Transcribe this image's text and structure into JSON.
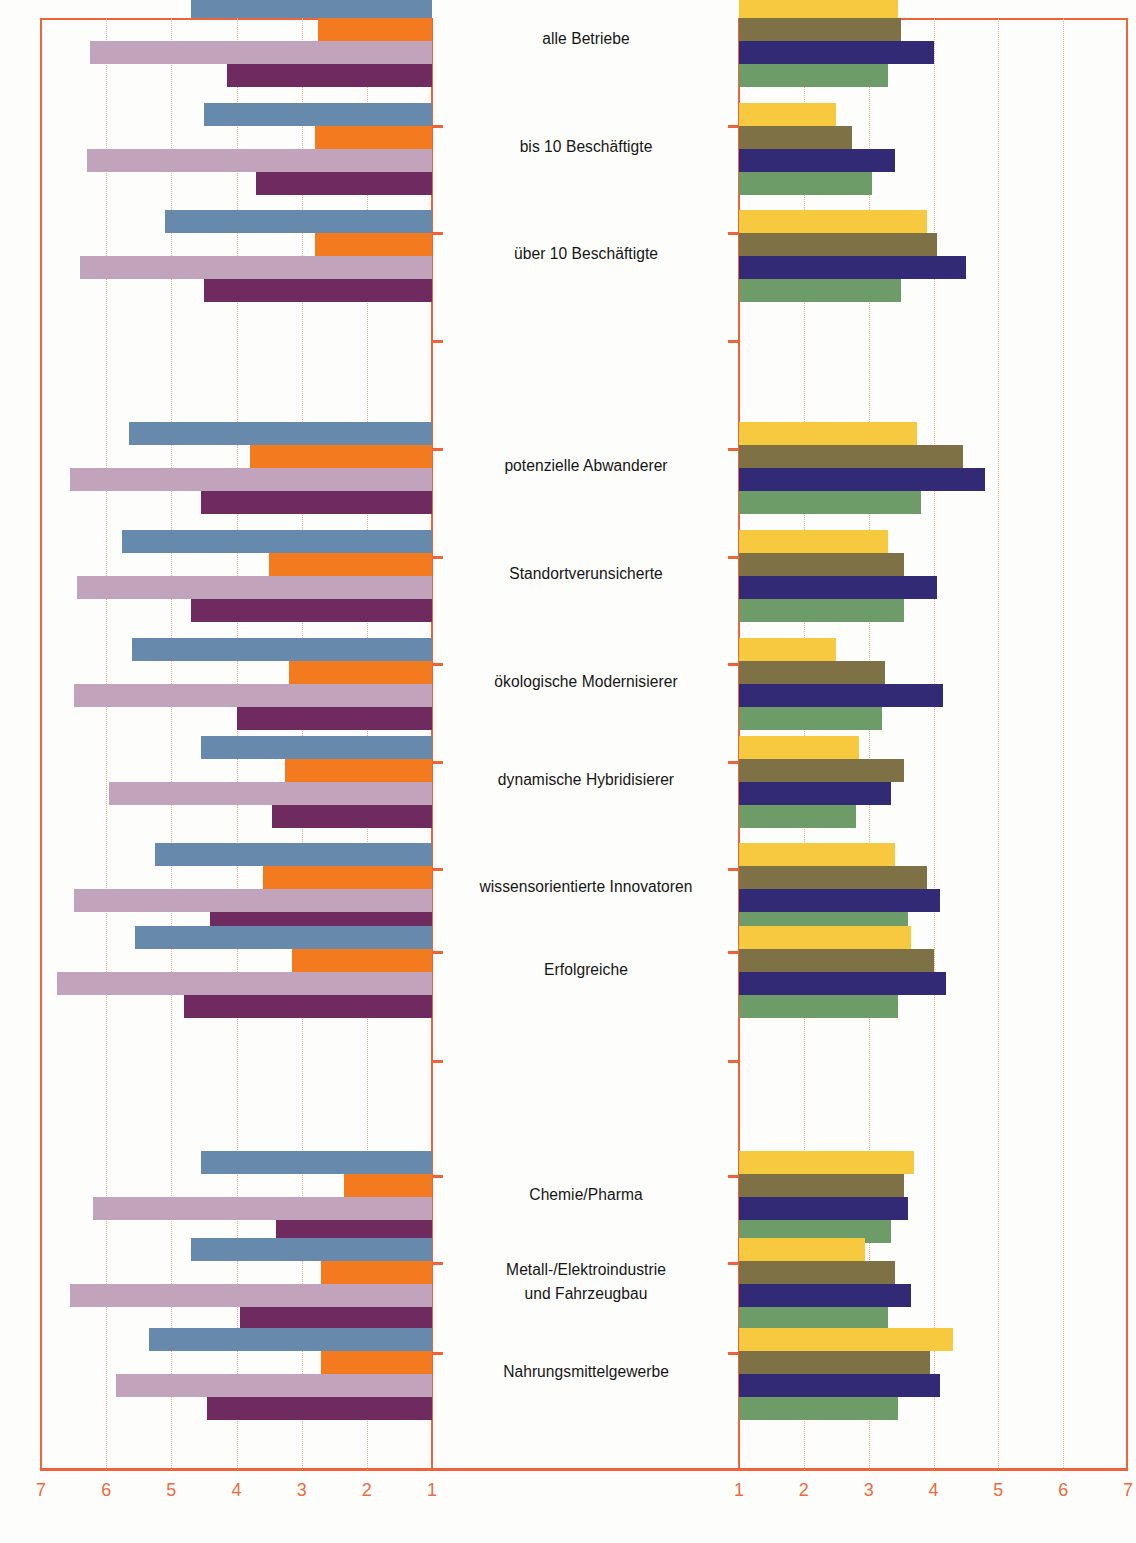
{
  "source_note": "(Quellen: eigene Erhebungen)",
  "axes": {
    "left_ticks": [
      7,
      6,
      5,
      4,
      3,
      2,
      1
    ],
    "right_ticks": [
      1,
      2,
      3,
      4,
      5,
      6,
      7
    ],
    "left_label_values": [
      "7",
      "6",
      "5",
      "4",
      "3",
      "2",
      "1"
    ],
    "right_label_values": [
      "1",
      "2",
      "3",
      "4",
      "5",
      "6",
      "7"
    ],
    "grid_color": "#f3a98b",
    "axis_color": "#f0623a",
    "range": [
      1,
      7
    ]
  },
  "palette": {
    "blue": "#6789ab",
    "orange": "#f37a1f",
    "light_mauve": "#c2a3bc",
    "dark_purple": "#6f2a5f",
    "yellow": "#f6c93f",
    "brown": "#7e7146",
    "navy": "#332a76",
    "green": "#6d9c69"
  },
  "categories": [
    {
      "label": "alle Betriebe",
      "lines": [
        "alle Betriebe"
      ]
    },
    {
      "label": "bis 10 Beschäftigte",
      "lines": [
        "bis 10 Beschäftigte"
      ]
    },
    {
      "label": "über 10 Beschäftigte",
      "lines": [
        "über 10 Beschäftigte"
      ]
    },
    {
      "label": "potenzielle Abwanderer",
      "lines": [
        "potenzielle Abwanderer"
      ]
    },
    {
      "label": "Standortverunsicherte",
      "lines": [
        "Standortverunsicherte"
      ]
    },
    {
      "label": "ökologische Modernisierer",
      "lines": [
        "ökologische Modernisierer"
      ]
    },
    {
      "label": "dynamische Hybridisierer",
      "lines": [
        "dynamische Hybridisierer"
      ]
    },
    {
      "label": "wissensorientierte Innovatoren",
      "lines": [
        "wissensorientierte Innovatoren"
      ]
    },
    {
      "label": "Erfolgreiche",
      "lines": [
        "Erfolgreiche"
      ]
    },
    {
      "label": "Chemie/Pharma",
      "lines": [
        "Chemie/Pharma"
      ]
    },
    {
      "label": "Metall-/Elektroindustrie und Fahrzeugbau",
      "lines": [
        "Metall-/Elektroindustrie",
        "und Fahrzeugbau"
      ]
    },
    {
      "label": "Nahrungsmittelgewerbe",
      "lines": [
        "Nahrungsmittelgewerbe"
      ]
    }
  ],
  "chart_data": {
    "type": "bar",
    "orientation": "horizontal",
    "layout": "two mirrored horizontal bar panels sharing central category labels; left panel axis runs 7→1 (right-anchored), right panel axis runs 1→7 (left-anchored)",
    "title": "",
    "xlabel": "",
    "ylabel": "",
    "xlim": [
      1,
      7
    ],
    "grid": true,
    "legend": "none shown",
    "categories": [
      "alle Betriebe",
      "bis 10 Beschäftigte",
      "über 10 Beschäftigte",
      "potenzielle Abwanderer",
      "Standortverunsicherte",
      "ökologische Modernisierer",
      "dynamische Hybridisierer",
      "wissensorientierte Innovatoren",
      "Erfolgreiche",
      "Chemie/Pharma",
      "Metall-/Elektroindustrie und Fahrzeugbau",
      "Nahrungsmittelgewerbe"
    ],
    "left_panel": {
      "axis_direction": "descending 7 to 1",
      "series": [
        {
          "name": "blue",
          "color": "#6789ab",
          "values": [
            4.7,
            4.5,
            5.1,
            5.65,
            5.75,
            5.6,
            4.55,
            5.25,
            5.55,
            4.55,
            4.7,
            5.35
          ]
        },
        {
          "name": "orange",
          "color": "#f37a1f",
          "values": [
            2.75,
            2.8,
            2.8,
            3.8,
            3.5,
            3.2,
            3.25,
            3.6,
            3.15,
            2.35,
            2.7,
            2.7
          ]
        },
        {
          "name": "light_mauve",
          "color": "#c2a3bc",
          "values": [
            6.25,
            6.3,
            6.4,
            6.55,
            6.45,
            6.5,
            5.95,
            6.5,
            6.75,
            6.2,
            6.55,
            5.85
          ]
        },
        {
          "name": "dark_purple",
          "color": "#6f2a5f",
          "values": [
            4.15,
            3.7,
            4.5,
            4.55,
            4.7,
            4.0,
            3.45,
            4.4,
            4.8,
            3.4,
            3.95,
            4.45
          ]
        }
      ]
    },
    "right_panel": {
      "axis_direction": "ascending 1 to 7",
      "series": [
        {
          "name": "yellow",
          "color": "#f6c93f",
          "values": [
            3.45,
            2.5,
            3.9,
            3.75,
            3.3,
            2.5,
            2.85,
            3.4,
            3.65,
            3.7,
            2.95,
            4.3
          ]
        },
        {
          "name": "brown",
          "color": "#7e7146",
          "values": [
            3.5,
            2.75,
            4.05,
            4.45,
            3.55,
            3.25,
            3.55,
            3.9,
            4.0,
            3.55,
            3.4,
            3.95
          ]
        },
        {
          "name": "navy",
          "color": "#332a76",
          "values": [
            4.0,
            3.4,
            4.5,
            4.8,
            4.05,
            4.15,
            3.35,
            4.1,
            4.2,
            3.6,
            3.65,
            4.1
          ]
        },
        {
          "name": "green",
          "color": "#6d9c69",
          "values": [
            3.3,
            3.05,
            3.5,
            3.8,
            3.55,
            3.2,
            2.8,
            3.6,
            3.45,
            3.35,
            3.3,
            3.45
          ]
        }
      ]
    }
  }
}
